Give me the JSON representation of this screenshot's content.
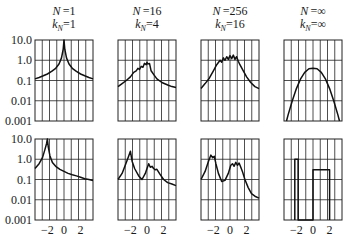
{
  "chart_data": {
    "type": "line",
    "title": "",
    "layout": {
      "rows": 2,
      "cols": 4,
      "grid": true,
      "yscale": "log",
      "legend": "none"
    },
    "ylim": [
      0.001,
      10.0
    ],
    "xlim": [
      -3.5,
      3.5
    ],
    "yticks": [
      "10.0",
      "1.0",
      "0.1",
      "0.01",
      "0.001"
    ],
    "xticks": [
      "−2",
      "0",
      "2"
    ],
    "columns": [
      {
        "N": "1",
        "kN": "1"
      },
      {
        "N": "16",
        "kN": "4"
      },
      {
        "N": "256",
        "kN": "16"
      },
      {
        "N": "∞",
        "kN": "∞"
      }
    ],
    "panels": [
      {
        "row": 0,
        "col": 0,
        "desc": "symmetric cusp peak at x=0",
        "x": [
          -3.5,
          -3,
          -2.5,
          -2,
          -1.5,
          -1,
          -0.6,
          -0.3,
          -0.1,
          0,
          0.1,
          0.3,
          0.6,
          1,
          1.5,
          2,
          2.5,
          3,
          3.5
        ],
        "y": [
          0.12,
          0.14,
          0.17,
          0.21,
          0.28,
          0.4,
          0.65,
          1.3,
          3.5,
          10,
          3.5,
          1.3,
          0.65,
          0.4,
          0.28,
          0.21,
          0.17,
          0.14,
          0.12
        ]
      },
      {
        "row": 0,
        "col": 1,
        "desc": "noisy peak near 0",
        "x": [
          -3.5,
          -3,
          -2.5,
          -2,
          -1.6,
          -1.3,
          -1.1,
          -0.9,
          -0.7,
          -0.5,
          -0.3,
          -0.1,
          0,
          0.1,
          0.3,
          0.5,
          0.8,
          1.2,
          1.8,
          2.5,
          3,
          3.5
        ],
        "y": [
          0.05,
          0.07,
          0.1,
          0.15,
          0.25,
          0.3,
          0.4,
          0.35,
          0.5,
          0.45,
          0.7,
          0.6,
          0.8,
          0.65,
          0.7,
          0.3,
          0.2,
          0.12,
          0.08,
          0.06,
          0.05,
          0.045
        ]
      },
      {
        "row": 0,
        "col": 2,
        "desc": "broad noisy plateau",
        "x": [
          -3.5,
          -3,
          -2.5,
          -2,
          -1.6,
          -1.2,
          -1,
          -0.8,
          -0.6,
          -0.4,
          -0.2,
          0,
          0.2,
          0.4,
          0.6,
          0.8,
          1,
          1.2,
          1.6,
          2,
          2.5,
          3,
          3.5
        ],
        "y": [
          0.04,
          0.07,
          0.13,
          0.3,
          0.6,
          1.0,
          0.8,
          1.3,
          1.0,
          1.5,
          1.1,
          1.7,
          1.2,
          1.8,
          1.1,
          1.5,
          0.9,
          0.6,
          0.3,
          0.15,
          0.08,
          0.05,
          0.04
        ]
      },
      {
        "row": 0,
        "col": 3,
        "desc": "smooth parabola in log scale (Gaussian)",
        "x": [
          -3.2,
          -3,
          -2.5,
          -2,
          -1.5,
          -1,
          -0.5,
          0,
          0.5,
          1,
          1.5,
          2,
          2.5,
          3,
          3.2
        ],
        "y": [
          0.001,
          0.002,
          0.01,
          0.04,
          0.12,
          0.25,
          0.38,
          0.4,
          0.38,
          0.25,
          0.12,
          0.04,
          0.01,
          0.002,
          0.001
        ]
      },
      {
        "row": 1,
        "col": 0,
        "desc": "cusp peak at x=-2 with slow decay",
        "x": [
          -3.5,
          -3,
          -2.6,
          -2.3,
          -2.1,
          -2,
          -1.9,
          -1.7,
          -1.4,
          -1,
          -0.5,
          0,
          0.5,
          1,
          1.5,
          2,
          2.5,
          3,
          3.5
        ],
        "y": [
          0.35,
          0.6,
          1.2,
          3,
          6,
          10,
          4,
          1.5,
          0.7,
          0.45,
          0.32,
          0.25,
          0.2,
          0.17,
          0.15,
          0.13,
          0.11,
          0.1,
          0.09
        ]
      },
      {
        "row": 1,
        "col": 1,
        "desc": "peak at -2 and noisy bump near 0.3",
        "x": [
          -3.5,
          -3,
          -2.5,
          -2.2,
          -2,
          -1.8,
          -1.5,
          -1,
          -0.6,
          -0.2,
          0,
          0.2,
          0.4,
          0.6,
          0.8,
          1,
          1.2,
          1.5,
          2,
          2.5,
          3,
          3.5
        ],
        "y": [
          0.1,
          0.2,
          0.7,
          1.5,
          2.5,
          0.8,
          0.35,
          0.15,
          0.1,
          0.2,
          0.35,
          0.6,
          0.4,
          0.45,
          0.35,
          0.3,
          0.32,
          0.2,
          0.1,
          0.07,
          0.06,
          0.05
        ]
      },
      {
        "row": 1,
        "col": 2,
        "desc": "twin noisy peaks at -2 and ~0.8",
        "x": [
          -3.5,
          -3,
          -2.6,
          -2.3,
          -2.1,
          -1.9,
          -1.7,
          -1.4,
          -1,
          -0.6,
          -0.2,
          0.1,
          0.3,
          0.5,
          0.7,
          0.9,
          1.1,
          1.3,
          1.5,
          1.8,
          2.2,
          2.6,
          3,
          3.5
        ],
        "y": [
          0.1,
          0.25,
          0.8,
          1.6,
          1.2,
          1.4,
          0.6,
          0.2,
          0.08,
          0.09,
          0.2,
          0.5,
          0.6,
          0.45,
          0.7,
          0.5,
          0.65,
          0.4,
          0.25,
          0.1,
          0.04,
          0.02,
          0.015,
          0.012
        ]
      },
      {
        "row": 1,
        "col": 3,
        "desc": "rectangular spectra: narrow box at -2, wide box 0..2",
        "x": [
          -2.2,
          -2.2,
          -1.8,
          -1.8,
          0,
          0,
          2,
          2
        ],
        "y": [
          0.001,
          1.0,
          1.0,
          0.001,
          0.001,
          0.3,
          0.3,
          0.001
        ]
      }
    ],
    "colors": {
      "line": "#111111",
      "grid": "#222222",
      "background": "#ffffff"
    }
  }
}
